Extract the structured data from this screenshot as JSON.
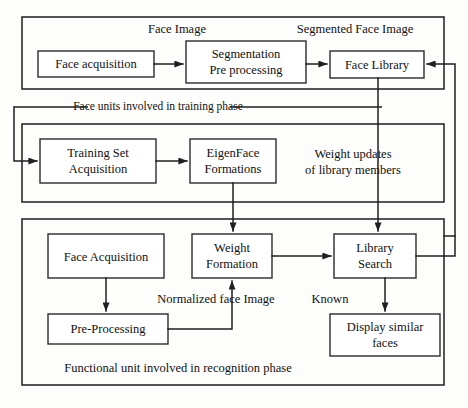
{
  "diagram": {
    "colors": {
      "stroke": "#1f1f1f",
      "box_fill": "#ffffff",
      "background": "#fdfdfc"
    },
    "sections": [
      {
        "id": "acquisition-phase",
        "caption": ""
      },
      {
        "id": "training-phase",
        "caption": "Face units involved in training phase"
      },
      {
        "id": "recognition-phase",
        "caption": "Functional unit involved in recognition phase"
      }
    ],
    "nodes": {
      "face_acquisition_top": {
        "line1": "Face acquisition"
      },
      "segmentation": {
        "line1": "Segmentation",
        "line2": "Pre processing"
      },
      "face_library": {
        "line1": "Face Library"
      },
      "training_set": {
        "line1": "Training Set",
        "line2": "Acquisition"
      },
      "eigenface": {
        "line1": "EigenFace",
        "line2": "Formations"
      },
      "face_acquisition_bottom": {
        "line1": "Face Acquisition"
      },
      "weight_formation": {
        "line1": "Weight",
        "line2": "Formation"
      },
      "library_search": {
        "line1": "Library",
        "line2": "Search"
      },
      "pre_processing": {
        "line1": "Pre-Processing"
      },
      "display_similar": {
        "line1": "Display similar",
        "line2": "faces"
      }
    },
    "edge_labels": {
      "face_image": "Face Image",
      "segmented_face_image": "Segmented Face Image",
      "weight_updates_line1": "Weight updates",
      "weight_updates_line2": "of library members",
      "normalized_face_image": "Normalized face Image",
      "known": "Known"
    },
    "captions": {
      "training_phase": "Face units involved in training phase",
      "recognition_phase": "Functional unit involved in recognition phase"
    }
  }
}
